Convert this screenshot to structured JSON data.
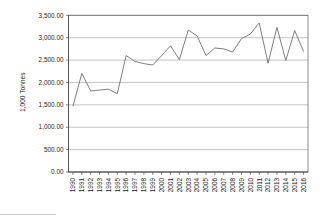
{
  "chart_data": {
    "type": "line",
    "title": "",
    "subtitle": "",
    "xlabel": "",
    "ylabel": "1,000 Tonnes",
    "categories": [
      "1990",
      "1991",
      "1992",
      "1993",
      "1994",
      "1995",
      "1996",
      "1997",
      "1998",
      "1999",
      "2000",
      "2001",
      "2002",
      "2003",
      "2004",
      "2005",
      "2006",
      "2007",
      "2008",
      "2009",
      "2010",
      "2011",
      "2012",
      "2013",
      "2014",
      "2015",
      "2016"
    ],
    "values": [
      1470.0,
      2200.0,
      1810.0,
      1830.0,
      1850.0,
      1750.0,
      2600.0,
      2470.0,
      2420.0,
      2390.0,
      2600.0,
      2820.0,
      2510.0,
      3170.0,
      3040.0,
      2600.0,
      2770.0,
      2750.0,
      2680.0,
      2980.0,
      3080.0,
      3330.0,
      2430.0,
      3230.0,
      2490.0,
      3160.0,
      2690.0
    ],
    "series": [
      {
        "name": "",
        "values": [
          1470.0,
          2200.0,
          1810.0,
          1830.0,
          1850.0,
          1750.0,
          2600.0,
          2470.0,
          2420.0,
          2390.0,
          2600.0,
          2820.0,
          2510.0,
          3170.0,
          3040.0,
          2600.0,
          2770.0,
          2750.0,
          2680.0,
          2980.0,
          3080.0,
          3330.0,
          2430.0,
          3230.0,
          2490.0,
          3160.0,
          2690.0
        ],
        "color": "#6f6f6f"
      }
    ],
    "ylim": [
      0,
      3500
    ],
    "ytick_values": [
      0,
      500,
      1000,
      1500,
      2000,
      2500,
      3000,
      3500
    ],
    "ytick_labels": [
      "0.00",
      "500.00",
      "1,000.00",
      "1,500.00",
      "2,000.00",
      "2,500.00",
      "3,000.00",
      "3,500.00"
    ],
    "xtick_labels": [
      "1990",
      "1991",
      "1992",
      "1993",
      "1994",
      "1995",
      "1996",
      "1997",
      "1998",
      "1999",
      "2000",
      "2001",
      "2002",
      "2003",
      "2004",
      "2005",
      "2006",
      "2007",
      "2008",
      "2009",
      "2010",
      "2011",
      "2012",
      "2013",
      "2014",
      "2015",
      "2016"
    ],
    "grid": true,
    "grid_axis": "y",
    "legend": false,
    "legend_position": "none",
    "annotations": []
  },
  "colors": {
    "line": "#6f6f6f",
    "grid": "#9a9a9a",
    "frame": "#6b6b6b",
    "axis": "#4d4d4d",
    "text": "#1a1a1a",
    "background": "#ffffff"
  }
}
